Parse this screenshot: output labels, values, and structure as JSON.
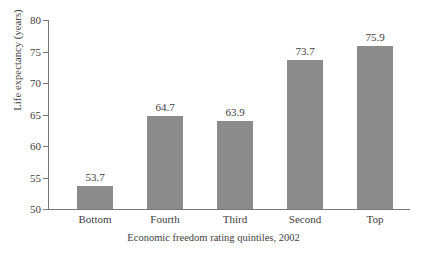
{
  "chart_data": {
    "type": "bar",
    "title": "",
    "subtitle": "",
    "categories": [
      "Bottom",
      "Fourth",
      "Third",
      "Second",
      "Top"
    ],
    "values": [
      53.7,
      64.7,
      63.9,
      73.7,
      75.9
    ],
    "value_labels": [
      "53.7",
      "64.7",
      "63.9",
      "73.7",
      "75.9"
    ],
    "series": [
      {
        "name": "Life expectancy",
        "values": [
          53.7,
          64.7,
          63.9,
          73.7,
          75.9
        ]
      }
    ],
    "xlabel": "Economic freedom rating quintiles, 2002",
    "ylabel": "Life expectancy (years)",
    "ylim": [
      50,
      80
    ],
    "ytick_values": [
      50,
      55,
      60,
      65,
      70,
      75,
      80
    ],
    "ytick_labels": [
      "50",
      "55",
      "60",
      "65",
      "70",
      "75",
      "80"
    ],
    "grid": false,
    "legend": false,
    "legend_position": "none",
    "bar_color": "#8b8b8b",
    "axis_color": "#777777",
    "text_color": "#3d3d3d",
    "background_color": "#ffffff"
  }
}
